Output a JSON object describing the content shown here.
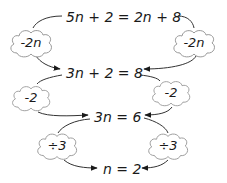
{
  "diagram": {
    "colors": {
      "text": "#1a1a1a",
      "line": "#333333",
      "cloud_stroke": "#999999",
      "background": "#ffffff"
    },
    "equations": [
      {
        "id": "step1",
        "text": "5n + 2 = 2n + 8"
      },
      {
        "id": "step2",
        "text": "3n + 2 = 8"
      },
      {
        "id": "step3",
        "text": "3n = 6"
      },
      {
        "id": "step4",
        "text": "n = 2"
      }
    ],
    "operations": [
      {
        "side": "left",
        "from": "step1",
        "to": "step2",
        "label": "-2n"
      },
      {
        "side": "right",
        "from": "step1",
        "to": "step2",
        "label": "-2n"
      },
      {
        "side": "left",
        "from": "step2",
        "to": "step3",
        "label": "-2"
      },
      {
        "side": "right",
        "from": "step2",
        "to": "step3",
        "label": "-2"
      },
      {
        "side": "left",
        "from": "step3",
        "to": "step4",
        "label": "÷3"
      },
      {
        "side": "right",
        "from": "step3",
        "to": "step4",
        "label": "÷3"
      }
    ]
  }
}
